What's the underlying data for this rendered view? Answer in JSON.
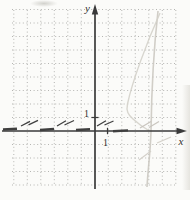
{
  "figure": {
    "labels": {
      "y_axis": "y",
      "x_axis": "x",
      "x_tick_1": "1",
      "y_tick_1": "1"
    },
    "colors": {
      "background": "#fbfbf9",
      "grid_dots": "#b5b5b2",
      "axis": "#3a3a3a",
      "text": "#2e2e2e",
      "dashed_curve": "#3f3f3f",
      "light_curve": "#c9c5be",
      "faint_curve": "#d4d1ca"
    }
  },
  "chart_data": {
    "type": "line",
    "title": "",
    "xlabel": "x",
    "ylabel": "y",
    "xlim": [
      -7,
      7
    ],
    "ylim": [
      -4.5,
      9
    ],
    "x_tick_labels": [
      "1"
    ],
    "y_tick_labels": [
      "1"
    ],
    "grid": "dotted",
    "legend_position": "none",
    "series": [
      {
        "name": "dashed-flat-curve",
        "style": "dashed, dark, hugs just above the x-axis",
        "x": [
          -6.7,
          -5.5,
          -4.5,
          -3.5,
          -2.5,
          -1.5,
          -0.5,
          0.5,
          1.5,
          2.5
        ],
        "y": [
          0.15,
          0.6,
          0.2,
          0.65,
          0.2,
          0.6,
          0.2,
          0.6,
          0.15,
          0.1
        ]
      },
      {
        "name": "steep-light-curve",
        "style": "solid, faint gray, nearly vertical, crosses x-axis near x≈4.2",
        "x": [
          4.7,
          4.3,
          4.2,
          4.15,
          4.0,
          3.9
        ],
        "y": [
          8.9,
          2.5,
          0.0,
          -1.0,
          -2.5,
          -4.2
        ]
      },
      {
        "name": "faint-diagonal-arc",
        "style": "solid, very faint, descends from upper right to a leftward bend near y≈2 then returns to axis",
        "x": [
          4.9,
          3.6,
          2.5,
          2.4,
          2.9,
          4.1
        ],
        "y": [
          8.8,
          5.0,
          2.0,
          1.5,
          0.9,
          0.0
        ]
      }
    ]
  }
}
